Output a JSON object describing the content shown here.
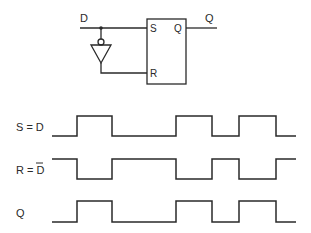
{
  "circuit": {
    "input_label": "D",
    "output_label": "Q",
    "pin_s": "S",
    "pin_q": "Q",
    "pin_r": "R",
    "inverter": "NOT gate (triangle with output bubble) feeding D̄ to R"
  },
  "timing": {
    "signals": [
      {
        "label": "S = D",
        "bar": false,
        "levels": [
          0,
          1,
          0,
          1,
          0,
          1,
          0
        ]
      },
      {
        "label_prefix": "R = ",
        "label_barred": "D",
        "bar": true,
        "levels": [
          1,
          0,
          1,
          0,
          1,
          0,
          1
        ]
      },
      {
        "label": "Q",
        "bar": false,
        "levels": [
          0,
          1,
          0,
          1,
          0,
          1,
          0
        ]
      }
    ],
    "transition_times": [
      0,
      25,
      60,
      124,
      160,
      187,
      224,
      244
    ]
  }
}
